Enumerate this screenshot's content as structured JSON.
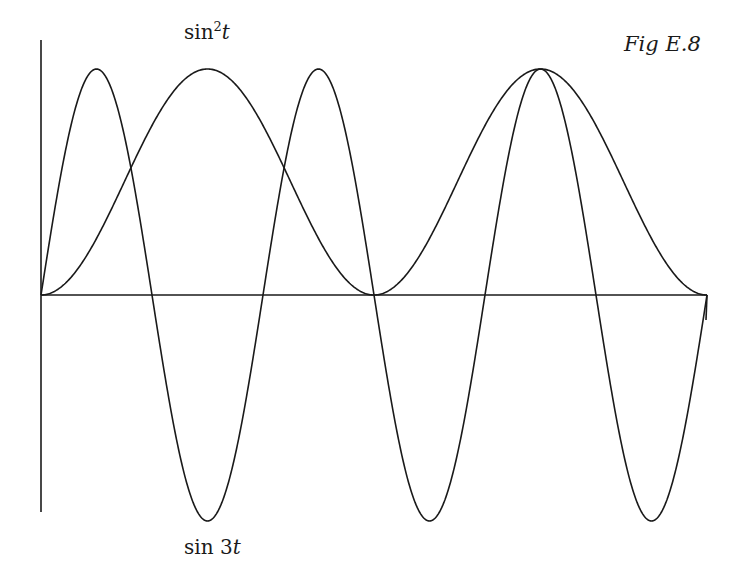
{
  "figure": {
    "title": "Fig E.8"
  },
  "labels": {
    "sin2_func": "sin",
    "sin2_exp": "2",
    "sin2_var": "t",
    "sin3_func": "sin 3",
    "sin3_var": "t"
  },
  "style": {
    "line_color": "#1a1a1a",
    "background": "#ffffff"
  },
  "chart_data": {
    "type": "line",
    "title": "Fig E.8",
    "xlabel": "t",
    "ylabel": "",
    "xlim": [
      0,
      6.2832
    ],
    "ylim": [
      -1,
      1
    ],
    "grid": false,
    "legend": "none (curves labelled directly: sin²t at top, sin 3t at bottom)",
    "series": [
      {
        "name": "sin²t",
        "label": "sin²t",
        "function": "sin(t)^2",
        "x": [
          0,
          0.5236,
          1.0472,
          1.5708,
          2.0944,
          2.618,
          3.1416,
          3.6652,
          4.1888,
          4.7124,
          5.236,
          5.7596,
          6.2832
        ],
        "values": [
          0,
          0.25,
          0.75,
          1,
          0.75,
          0.25,
          0,
          0.25,
          0.75,
          1,
          0.75,
          0.25,
          0
        ]
      },
      {
        "name": "sin 3t",
        "label": "sin 3t",
        "function": "sin(3t)",
        "x": [
          0,
          0.5236,
          1.0472,
          1.5708,
          2.0944,
          2.618,
          3.1416,
          3.6652,
          4.1888,
          4.7124,
          5.236,
          5.7596,
          6.2832
        ],
        "values": [
          0,
          1,
          0,
          -1,
          0,
          1,
          0,
          -1,
          0,
          1,
          0,
          -1,
          0
        ]
      }
    ],
    "axes": {
      "origin_px": [
        41,
        295
      ],
      "x_end_px": 707,
      "y_top_px": 40,
      "y_bottom_px": 512,
      "unit_px": 226
    }
  }
}
